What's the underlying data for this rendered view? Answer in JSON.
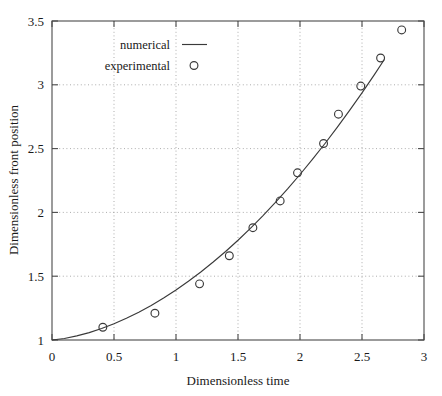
{
  "chart_data": {
    "type": "scatter",
    "title": "",
    "xlabel": "Dimensionless time",
    "ylabel": "Dimensionless front position",
    "xlim": [
      0,
      3
    ],
    "ylim": [
      1,
      3.5
    ],
    "xticks": [
      "0",
      "0.5",
      "1",
      "1.5",
      "2",
      "2.5",
      "3"
    ],
    "xtick_values": [
      0,
      0.5,
      1,
      1.5,
      2,
      2.5,
      3
    ],
    "yticks": [
      "1",
      "1.5",
      "2",
      "2.5",
      "3",
      "3.5"
    ],
    "ytick_values": [
      1,
      1.5,
      2,
      2.5,
      3,
      3.5
    ],
    "grid": true,
    "grid_style": "dotted",
    "legend_position": "upper-left-inside",
    "series": [
      {
        "name": "numerical",
        "type": "line",
        "marker": "none",
        "color": "#3a3a3a",
        "x": [
          0.0,
          0.1,
          0.2,
          0.3,
          0.4,
          0.5,
          0.6,
          0.7,
          0.8,
          0.9,
          1.0,
          1.1,
          1.2,
          1.3,
          1.4,
          1.5,
          1.6,
          1.7,
          1.8,
          1.9,
          2.0,
          2.1,
          2.2,
          2.3,
          2.4,
          2.5,
          2.6,
          2.68
        ],
        "y": [
          1.0,
          1.012,
          1.032,
          1.058,
          1.09,
          1.127,
          1.17,
          1.218,
          1.271,
          1.329,
          1.392,
          1.46,
          1.533,
          1.611,
          1.694,
          1.782,
          1.875,
          1.973,
          2.076,
          2.184,
          2.297,
          2.415,
          2.538,
          2.666,
          2.799,
          2.937,
          3.08,
          3.198
        ]
      },
      {
        "name": "experimental",
        "type": "scatter",
        "marker": "circle-open",
        "color": "#3a3a3a",
        "x": [
          0.41,
          0.83,
          1.19,
          1.43,
          1.62,
          1.84,
          1.98,
          2.19,
          2.31,
          2.49,
          2.65,
          2.82
        ],
        "y": [
          1.1,
          1.21,
          1.44,
          1.66,
          1.88,
          2.09,
          2.31,
          2.54,
          2.77,
          2.99,
          3.21,
          3.43
        ]
      }
    ]
  },
  "legend": {
    "entries": [
      {
        "label": "numerical",
        "symbol": "line"
      },
      {
        "label": "experimental",
        "symbol": "circle"
      }
    ]
  }
}
